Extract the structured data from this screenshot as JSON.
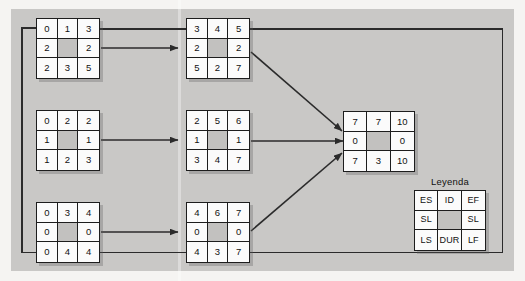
{
  "diagram": {
    "title_legend": "Leyenda",
    "legend_cells": [
      "ES",
      "ID",
      "EF",
      "SL",
      "",
      "SL",
      "LS",
      "DUR",
      "LF"
    ],
    "nodes": [
      {
        "id": "node-top-left",
        "cells": [
          "0",
          "1",
          "3",
          "2",
          "",
          "2",
          "2",
          "3",
          "5"
        ]
      },
      {
        "id": "node-top-center",
        "cells": [
          "3",
          "4",
          "5",
          "2",
          "",
          "2",
          "5",
          "2",
          "7"
        ]
      },
      {
        "id": "node-middle-left",
        "cells": [
          "0",
          "2",
          "2",
          "1",
          "",
          "1",
          "1",
          "2",
          "3"
        ]
      },
      {
        "id": "node-middle-center",
        "cells": [
          "2",
          "5",
          "6",
          "1",
          "",
          "1",
          "3",
          "4",
          "7"
        ]
      },
      {
        "id": "node-bottom-left",
        "cells": [
          "0",
          "3",
          "4",
          "0",
          "",
          "0",
          "0",
          "4",
          "4"
        ]
      },
      {
        "id": "node-bottom-center",
        "cells": [
          "4",
          "6",
          "7",
          "0",
          "",
          "0",
          "4",
          "3",
          "7"
        ]
      },
      {
        "id": "node-right-end",
        "cells": [
          "7",
          "7",
          "10",
          "0",
          "",
          "0",
          "7",
          "3",
          "10"
        ]
      }
    ],
    "colors": {
      "background": "#c9c8c6",
      "cell_fill": "#fbfbfb",
      "cell_shaded": "#c2c1bf",
      "line": "#2b2b2b",
      "text": "#111111"
    }
  }
}
